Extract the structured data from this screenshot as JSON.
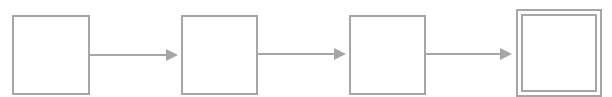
{
  "diagram": {
    "type": "state-chain",
    "stroke_color": "#a6a6a6",
    "states": [
      {
        "id": "s1",
        "label": "",
        "final": false,
        "x": 12,
        "y": 15,
        "w": 78,
        "h": 80
      },
      {
        "id": "s2",
        "label": "",
        "final": false,
        "x": 181,
        "y": 15,
        "w": 77,
        "h": 80
      },
      {
        "id": "s3",
        "label": "",
        "final": false,
        "x": 349,
        "y": 15,
        "w": 77,
        "h": 80
      },
      {
        "id": "s4",
        "label": "",
        "final": true,
        "x": 516,
        "y": 9,
        "w": 86,
        "h": 88
      }
    ],
    "edges": [
      {
        "from": "s1",
        "to": "s2",
        "label": ""
      },
      {
        "from": "s2",
        "to": "s3",
        "label": ""
      },
      {
        "from": "s3",
        "to": "s4",
        "label": ""
      }
    ]
  }
}
